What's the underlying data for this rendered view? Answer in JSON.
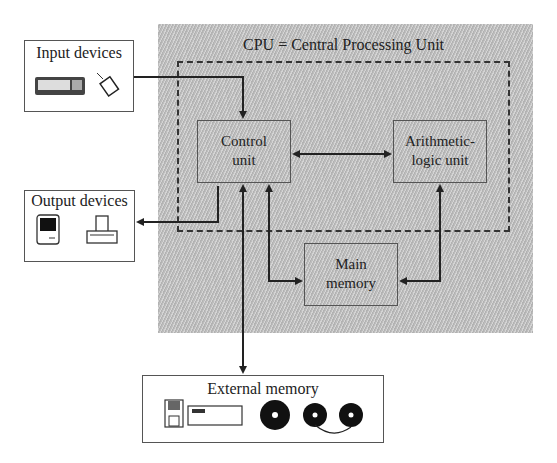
{
  "diagram": {
    "cpu_title": "CPU = Central Processing Unit",
    "nodes": {
      "input_devices": {
        "label": "Input devices",
        "icons": [
          "keyboard-icon",
          "mouse-icon"
        ]
      },
      "output_devices": {
        "label": "Output devices",
        "icons": [
          "monitor-icon",
          "printer-icon"
        ]
      },
      "control_unit": {
        "line1": "Control",
        "line2": "unit"
      },
      "alu": {
        "line1": "Arithmetic-",
        "line2": "logic unit"
      },
      "main_memory": {
        "line1": "Main",
        "line2": "memory"
      },
      "external_memory": {
        "label": "External memory",
        "icons": [
          "floppy-disk-icon",
          "disk-drive-icon",
          "disk-icon",
          "tape-reel-icon",
          "tape-reel-icon"
        ]
      }
    },
    "edges": [
      {
        "from": "Input devices",
        "to": "Control unit",
        "direction": "one-way"
      },
      {
        "from": "Control unit",
        "to": "Output devices",
        "direction": "one-way"
      },
      {
        "from": "Control unit",
        "to": "Arithmetic-logic unit",
        "direction": "two-way"
      },
      {
        "from": "Control unit",
        "to": "Main memory",
        "direction": "two-way"
      },
      {
        "from": "Arithmetic-logic unit",
        "to": "Main memory",
        "direction": "two-way"
      },
      {
        "from": "Control unit",
        "to": "External memory",
        "direction": "two-way"
      }
    ],
    "colors": {
      "cpu_background": "#bdbdbd",
      "line": "#222222",
      "box_border": "#555555"
    }
  }
}
